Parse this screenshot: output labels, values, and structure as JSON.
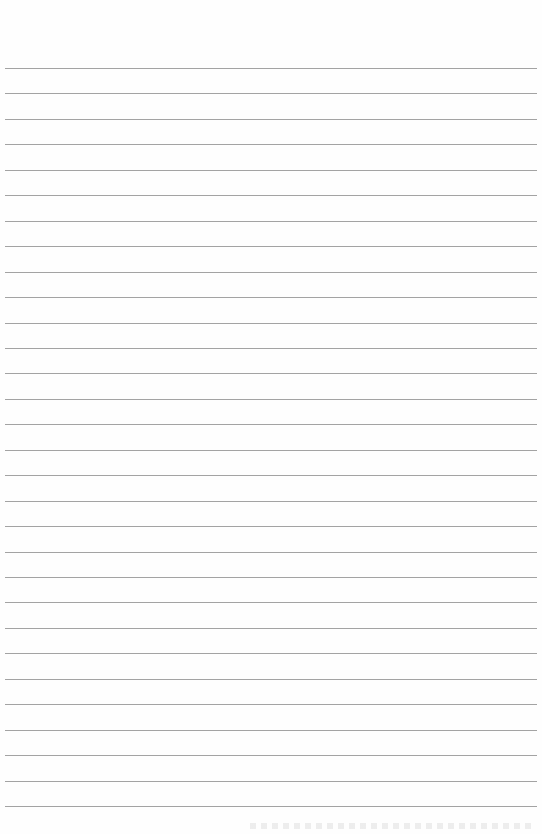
{
  "page": {
    "type": "blank lined paper",
    "background_color": "#ffffff",
    "rule_color": "#a3a3a3",
    "rule_count": 30,
    "first_rule_y": 68,
    "rule_spacing_px": 25.45,
    "rule_left_x": 5,
    "rule_right_x": 537
  }
}
